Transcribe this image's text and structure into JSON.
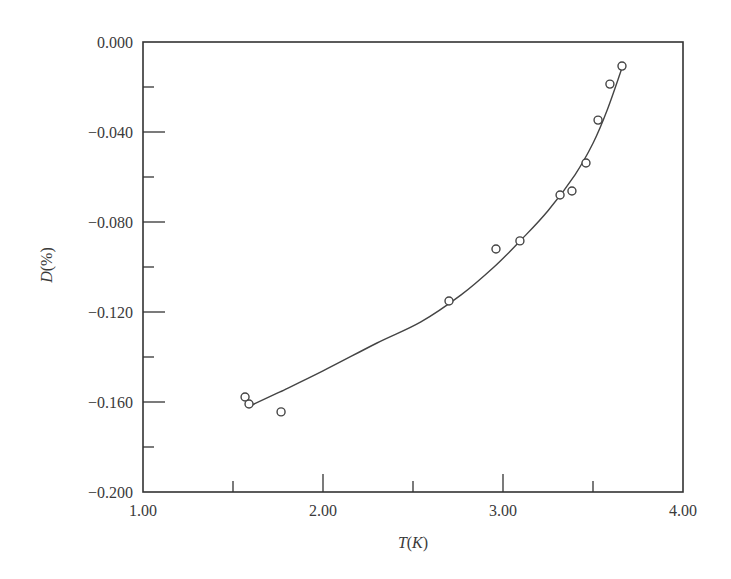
{
  "chart_data": {
    "type": "scatter",
    "title": "",
    "xlabel": "T(K)",
    "ylabel": "D(%)",
    "xlabel_parts": {
      "var": "T",
      "open": "(",
      "unit": "K",
      "close": ")"
    },
    "ylabel_parts": {
      "var": "D",
      "rest": "(%)"
    },
    "xlim": [
      1.0,
      4.0
    ],
    "ylim": [
      -0.2,
      0.0
    ],
    "x_ticks": [
      1.0,
      2.0,
      3.0,
      4.0
    ],
    "x_tick_labels": [
      "1.00",
      "2.00",
      "3.00",
      "4.00"
    ],
    "x_minor_ticks": [
      1.5,
      2.5,
      3.5
    ],
    "y_ticks": [
      0.0,
      -0.04,
      -0.08,
      -0.12,
      -0.16,
      -0.2
    ],
    "y_tick_labels": [
      "0.000",
      "−0.040",
      "−0.080",
      "−0.120",
      "−0.160",
      "−0.200"
    ],
    "y_minor_ticks": [
      -0.02,
      -0.06,
      -0.1,
      -0.14,
      -0.18
    ],
    "grid": false,
    "legend": null,
    "series": [
      {
        "name": "measured",
        "marker": "open-circle",
        "points": [
          {
            "x": 1.567,
            "y": -0.1578
          },
          {
            "x": 1.589,
            "y": -0.1609
          },
          {
            "x": 1.767,
            "y": -0.1644
          },
          {
            "x": 2.7,
            "y": -0.1151
          },
          {
            "x": 2.961,
            "y": -0.092
          },
          {
            "x": 3.094,
            "y": -0.0884
          },
          {
            "x": 3.317,
            "y": -0.068
          },
          {
            "x": 3.383,
            "y": -0.0662
          },
          {
            "x": 3.461,
            "y": -0.0538
          },
          {
            "x": 3.528,
            "y": -0.0347
          },
          {
            "x": 3.594,
            "y": -0.0187
          },
          {
            "x": 3.661,
            "y": -0.0107
          }
        ]
      },
      {
        "name": "fit",
        "marker": "none",
        "line": "solid",
        "points": [
          {
            "x": 1.594,
            "y": -0.1618
          },
          {
            "x": 1.761,
            "y": -0.1555
          },
          {
            "x": 2.0,
            "y": -0.1462
          },
          {
            "x": 2.3,
            "y": -0.1338
          },
          {
            "x": 2.544,
            "y": -0.1244
          },
          {
            "x": 2.767,
            "y": -0.1124
          },
          {
            "x": 2.95,
            "y": -0.1
          },
          {
            "x": 3.1,
            "y": -0.088
          },
          {
            "x": 3.25,
            "y": -0.075
          },
          {
            "x": 3.4,
            "y": -0.059
          },
          {
            "x": 3.5,
            "y": -0.045
          },
          {
            "x": 3.58,
            "y": -0.03
          },
          {
            "x": 3.661,
            "y": -0.0116
          }
        ]
      }
    ]
  },
  "style": {
    "axis_color": "#333333",
    "marker_color": "#444444",
    "line_color": "#444444",
    "background": "#ffffff"
  }
}
